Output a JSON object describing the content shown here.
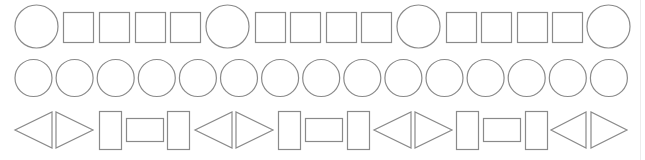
{
  "canvas": {
    "width": 645,
    "height": 160,
    "background": "#ffffff"
  },
  "style": {
    "stroke": "#8a8a8a",
    "fill": "#ffffff",
    "stroke_width": 1.2
  },
  "rows": [
    {
      "name": "row-1",
      "description": "circle followed by four squares, repeated; ends with a circle",
      "pattern": [
        "circle",
        "square",
        "square",
        "square",
        "square"
      ],
      "shapes": [
        {
          "type": "circle",
          "cx": 36.5,
          "cy": 26.5,
          "r": 21.5
        },
        {
          "type": "square",
          "x": 63,
          "y": 12,
          "w": 30,
          "h": 30
        },
        {
          "type": "square",
          "x": 99,
          "y": 12,
          "w": 30,
          "h": 30
        },
        {
          "type": "square",
          "x": 135,
          "y": 12,
          "w": 30,
          "h": 30
        },
        {
          "type": "square",
          "x": 170,
          "y": 12,
          "w": 30,
          "h": 30
        },
        {
          "type": "circle",
          "cx": 227.5,
          "cy": 26.5,
          "r": 21.5
        },
        {
          "type": "square",
          "x": 255,
          "y": 12,
          "w": 30,
          "h": 30
        },
        {
          "type": "square",
          "x": 290,
          "y": 12,
          "w": 30,
          "h": 30
        },
        {
          "type": "square",
          "x": 326,
          "y": 12,
          "w": 30,
          "h": 30
        },
        {
          "type": "square",
          "x": 361,
          "y": 12,
          "w": 30,
          "h": 30
        },
        {
          "type": "circle",
          "cx": 418.5,
          "cy": 26.5,
          "r": 21.5
        },
        {
          "type": "square",
          "x": 446,
          "y": 12,
          "w": 30,
          "h": 30
        },
        {
          "type": "square",
          "x": 481,
          "y": 12,
          "w": 30,
          "h": 30
        },
        {
          "type": "square",
          "x": 517,
          "y": 12,
          "w": 30,
          "h": 30
        },
        {
          "type": "square",
          "x": 552,
          "y": 12,
          "w": 30,
          "h": 30
        },
        {
          "type": "circle",
          "cx": 608.5,
          "cy": 26.5,
          "r": 21.5
        }
      ]
    },
    {
      "name": "row-2",
      "description": "fifteen equal circles",
      "pattern": [
        "circle"
      ],
      "shapes": [
        {
          "type": "circle",
          "cx": 33.5,
          "cy": 78,
          "r": 18.5
        },
        {
          "type": "circle",
          "cx": 74.6,
          "cy": 78,
          "r": 18.5
        },
        {
          "type": "circle",
          "cx": 115.7,
          "cy": 78,
          "r": 18.5
        },
        {
          "type": "circle",
          "cx": 156.8,
          "cy": 78,
          "r": 18.5
        },
        {
          "type": "circle",
          "cx": 197.9,
          "cy": 78,
          "r": 18.5
        },
        {
          "type": "circle",
          "cx": 239.0,
          "cy": 78,
          "r": 18.5
        },
        {
          "type": "circle",
          "cx": 280.1,
          "cy": 78,
          "r": 18.5
        },
        {
          "type": "circle",
          "cx": 321.2,
          "cy": 78,
          "r": 18.5
        },
        {
          "type": "circle",
          "cx": 362.3,
          "cy": 78,
          "r": 18.5
        },
        {
          "type": "circle",
          "cx": 403.4,
          "cy": 78,
          "r": 18.5
        },
        {
          "type": "circle",
          "cx": 444.5,
          "cy": 78,
          "r": 18.5
        },
        {
          "type": "circle",
          "cx": 485.6,
          "cy": 78,
          "r": 18.5
        },
        {
          "type": "circle",
          "cx": 526.7,
          "cy": 78,
          "r": 18.5
        },
        {
          "type": "circle",
          "cx": 567.8,
          "cy": 78,
          "r": 18.5
        },
        {
          "type": "circle",
          "cx": 608.9,
          "cy": 78,
          "r": 18.5
        }
      ]
    },
    {
      "name": "row-3",
      "description": "left triangle, right triangle, tall rectangle, wide rectangle, tall rectangle, repeated; ends with two triangles",
      "pattern": [
        "triangle-left",
        "triangle-right",
        "rect-tall",
        "rect-wide",
        "rect-tall"
      ],
      "shapes": [
        {
          "type": "triangle-left",
          "x": 15,
          "y": 112,
          "w": 37,
          "h": 36
        },
        {
          "type": "triangle-right",
          "x": 56,
          "y": 112,
          "w": 37,
          "h": 36
        },
        {
          "type": "rect-tall",
          "x": 99,
          "y": 111,
          "w": 22,
          "h": 38
        },
        {
          "type": "rect-wide",
          "x": 126,
          "y": 118,
          "w": 37,
          "h": 23
        },
        {
          "type": "rect-tall",
          "x": 167,
          "y": 111,
          "w": 22,
          "h": 38
        },
        {
          "type": "triangle-left",
          "x": 195,
          "y": 112,
          "w": 37,
          "h": 36
        },
        {
          "type": "triangle-right",
          "x": 236,
          "y": 112,
          "w": 37,
          "h": 36
        },
        {
          "type": "rect-tall",
          "x": 278,
          "y": 111,
          "w": 22,
          "h": 38
        },
        {
          "type": "rect-wide",
          "x": 305,
          "y": 118,
          "w": 37,
          "h": 23
        },
        {
          "type": "rect-tall",
          "x": 347,
          "y": 111,
          "w": 22,
          "h": 38
        },
        {
          "type": "triangle-left",
          "x": 374,
          "y": 112,
          "w": 37,
          "h": 36
        },
        {
          "type": "triangle-right",
          "x": 415,
          "y": 112,
          "w": 37,
          "h": 36
        },
        {
          "type": "rect-tall",
          "x": 456,
          "y": 111,
          "w": 22,
          "h": 38
        },
        {
          "type": "rect-wide",
          "x": 483,
          "y": 118,
          "w": 37,
          "h": 23
        },
        {
          "type": "rect-tall",
          "x": 525,
          "y": 111,
          "w": 22,
          "h": 38
        },
        {
          "type": "triangle-left",
          "x": 551,
          "y": 112,
          "w": 35,
          "h": 36
        },
        {
          "type": "triangle-right",
          "x": 591,
          "y": 112,
          "w": 36,
          "h": 36
        }
      ]
    }
  ]
}
